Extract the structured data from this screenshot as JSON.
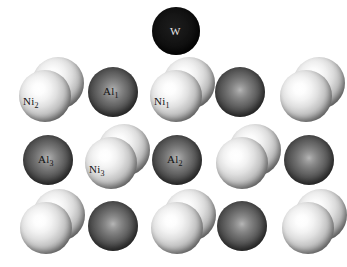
{
  "figure": {
    "background_color": "#ffffff",
    "width": 347,
    "height": 267
  },
  "colors": {
    "light_sphere": "#f2f2f2",
    "dark_sphere": "#5a5a5a",
    "black_sphere": "#0d0d0d",
    "label_text": "#141414",
    "label_text_on_black": "#e8e8e8"
  },
  "legend_semantics": {
    "light_sphere_element": "Ni",
    "dark_sphere_element": "Al",
    "black_sphere_element": "W"
  },
  "rows": [
    {
      "row_index": 1,
      "y": 7,
      "sites": [
        {
          "id": "w-adatom",
          "type": "black",
          "pair": false,
          "cx": 176,
          "cy": 31,
          "r": 24,
          "label": "W",
          "label_sub": "",
          "label_dx": -6,
          "label_dy": -5
        }
      ]
    },
    {
      "row_index": 2,
      "y": 62,
      "sites": [
        {
          "id": "ni2",
          "type": "light",
          "pair": true,
          "cx": 45,
          "cy": 96,
          "r": 26,
          "label": "Ni",
          "label_sub": "2",
          "label_dx": -22,
          "label_dy": 0
        },
        {
          "id": "al1",
          "type": "dark",
          "pair": false,
          "cx": 113,
          "cy": 92,
          "r": 25,
          "label": "Al",
          "label_sub": "1",
          "label_dx": -10,
          "label_dy": -6
        },
        {
          "id": "ni1",
          "type": "light",
          "pair": true,
          "cx": 176,
          "cy": 96,
          "r": 26,
          "label": "Ni",
          "label_sub": "1",
          "label_dx": -22,
          "label_dy": 0
        },
        {
          "id": "r2c4",
          "type": "dark",
          "pair": false,
          "cx": 240,
          "cy": 92,
          "r": 25,
          "label": "",
          "label_sub": "",
          "label_dx": 0,
          "label_dy": 0
        },
        {
          "id": "r2c5",
          "type": "light",
          "pair": true,
          "cx": 306,
          "cy": 96,
          "r": 26,
          "label": "",
          "label_sub": "",
          "label_dx": 0,
          "label_dy": 0
        }
      ]
    },
    {
      "row_index": 3,
      "y": 130,
      "sites": [
        {
          "id": "al3",
          "type": "dark",
          "pair": false,
          "cx": 48,
          "cy": 160,
          "r": 25,
          "label": "Al",
          "label_dx": -10,
          "label_sub": "3",
          "label_dy": -6
        },
        {
          "id": "ni3",
          "type": "light",
          "pair": true,
          "cx": 111,
          "cy": 163,
          "r": 26,
          "label": "Ni",
          "label_sub": "3",
          "label_dx": -22,
          "label_dy": 1
        },
        {
          "id": "al2",
          "type": "dark",
          "pair": false,
          "cx": 177,
          "cy": 160,
          "r": 25,
          "label": "Al",
          "label_sub": "2",
          "label_dx": -10,
          "label_dy": -6
        },
        {
          "id": "r3c4",
          "type": "light",
          "pair": true,
          "cx": 242,
          "cy": 163,
          "r": 26,
          "label": "",
          "label_sub": "",
          "label_dx": 0,
          "label_dy": 0
        },
        {
          "id": "r3c5",
          "type": "dark",
          "pair": false,
          "cx": 309,
          "cy": 160,
          "r": 25,
          "label": "",
          "label_sub": "",
          "label_dx": 0,
          "label_dy": 0
        }
      ]
    },
    {
      "row_index": 4,
      "y": 196,
      "sites": [
        {
          "id": "r4c1",
          "type": "light",
          "pair": true,
          "cx": 46,
          "cy": 228,
          "r": 26,
          "label": "",
          "label_sub": "",
          "label_dx": 0,
          "label_dy": 0
        },
        {
          "id": "r4c2",
          "type": "dark",
          "pair": false,
          "cx": 113,
          "cy": 226,
          "r": 25,
          "label": "",
          "label_sub": "",
          "label_dx": 0,
          "label_dy": 0
        },
        {
          "id": "r4c3",
          "type": "light",
          "pair": true,
          "cx": 177,
          "cy": 228,
          "r": 26,
          "label": "",
          "label_sub": "",
          "label_dx": 0,
          "label_dy": 0
        },
        {
          "id": "r4c4",
          "type": "dark",
          "pair": false,
          "cx": 242,
          "cy": 226,
          "r": 25,
          "label": "",
          "label_sub": "",
          "label_dx": 0,
          "label_dy": 0
        },
        {
          "id": "r4c5",
          "type": "light",
          "pair": true,
          "cx": 308,
          "cy": 228,
          "r": 26,
          "label": "",
          "label_sub": "",
          "label_dx": 0,
          "label_dy": 0
        }
      ]
    }
  ],
  "pair_offset": {
    "back_dx": 13,
    "back_dy": -13
  }
}
